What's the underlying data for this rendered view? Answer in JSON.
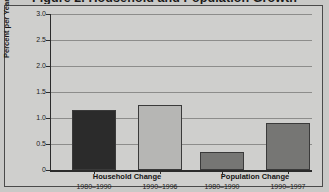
{
  "chart_data": {
    "type": "bar",
    "title": "Figure 2. Household and Population Growth",
    "xlabel": "",
    "ylabel": "Percent per Year",
    "ylim": [
      0,
      3.0
    ],
    "ytick_labels": [
      "0",
      "0.5",
      "1.0",
      "1.5",
      "2.0",
      "2.5",
      "3.0"
    ],
    "ytick_values": [
      0,
      0.5,
      1.0,
      1.5,
      2.0,
      2.5,
      3.0
    ],
    "grid": true,
    "legend": "none",
    "groups": [
      {
        "name": "Household Change",
        "bars": [
          {
            "category": "1980–1990",
            "value": 1.16,
            "color": "#2b2b2b"
          },
          {
            "category": "1990–1996",
            "value": 1.25,
            "color": "#b6b6b4"
          }
        ]
      },
      {
        "name": "Population Change",
        "bars": [
          {
            "category": "1980–1990",
            "value": 0.35,
            "color": "#767674"
          },
          {
            "category": "1990–1997",
            "value": 0.9,
            "color": "#767674"
          }
        ]
      }
    ],
    "categories": [
      "1980–1990",
      "1990–1996",
      "1980–1990",
      "1990–1997"
    ],
    "values": [
      1.16,
      1.25,
      0.35,
      0.9
    ],
    "colors": {
      "background": "#c9c9c7",
      "panel": "#cfcfcd",
      "axis": "#2b2b2b",
      "gridline": "#8d8d8b",
      "bar_dark": "#2b2b2b",
      "bar_light": "#b6b6b4",
      "bar_medium": "#767674",
      "text": "#1a1a1a"
    }
  }
}
